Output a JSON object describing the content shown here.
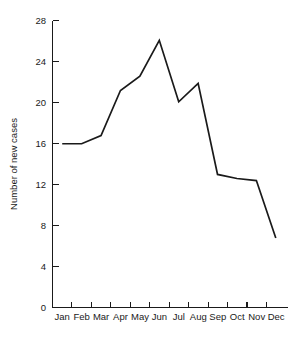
{
  "chart_data": {
    "type": "line",
    "title": "",
    "subtitle": "",
    "xlabel": "",
    "ylabel": "Number of new cases",
    "categories": [
      "Jan",
      "Feb",
      "Mar",
      "Apr",
      "May",
      "Jun",
      "Jul",
      "Aug",
      "Sep",
      "Oct",
      "Nov",
      "Dec"
    ],
    "values": [
      16.0,
      16.0,
      16.8,
      21.2,
      22.6,
      26.1,
      20.1,
      21.9,
      13.0,
      12.6,
      12.4,
      6.8
    ],
    "series": [
      {
        "name": "Number of new cases",
        "values": [
          16.0,
          16.0,
          16.8,
          21.2,
          22.6,
          26.1,
          20.1,
          21.9,
          13.0,
          12.6,
          12.4,
          6.8
        ]
      }
    ],
    "ylim": [
      0,
      28
    ],
    "yticks": [
      0,
      4,
      8,
      12,
      16,
      20,
      24,
      28
    ],
    "ytick_labels": [
      "0",
      "4",
      "8",
      "12",
      "16",
      "20",
      "24",
      "28"
    ],
    "xtick_labels": [
      "Jan",
      "Feb",
      "Mar",
      "Apr",
      "May",
      "Jun",
      "Jul",
      "Aug",
      "Sep",
      "Oct",
      "Nov",
      "Dec"
    ],
    "grid": false,
    "legend": false,
    "legend_position": "none",
    "line_color": "#1a1a1a",
    "background_color": "#ffffff",
    "annotations": []
  },
  "axes": {
    "y_title": "Number of new cases",
    "y_ticks": [
      {
        "label": "28",
        "value": 28
      },
      {
        "label": "24",
        "value": 24
      },
      {
        "label": "20",
        "value": 20
      },
      {
        "label": "16",
        "value": 16
      },
      {
        "label": "12",
        "value": 12
      },
      {
        "label": "8",
        "value": 8
      },
      {
        "label": "4",
        "value": 4
      },
      {
        "label": "0",
        "value": 0
      }
    ],
    "x_ticks": [
      {
        "label": "Jan"
      },
      {
        "label": "Feb"
      },
      {
        "label": "Mar"
      },
      {
        "label": "Apr"
      },
      {
        "label": "May"
      },
      {
        "label": "Jun"
      },
      {
        "label": "Jul"
      },
      {
        "label": "Aug"
      },
      {
        "label": "Sep"
      },
      {
        "label": "Oct"
      },
      {
        "label": "Nov"
      },
      {
        "label": "Dec"
      }
    ]
  }
}
